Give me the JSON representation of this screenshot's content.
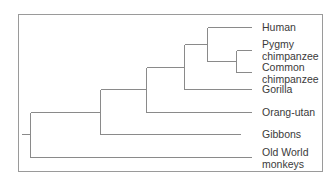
{
  "diagram": {
    "type": "phylogenetic-tree",
    "line_color": "#8a8a8a",
    "text_color": "#3a3a3a",
    "frame_color": "#9a9a9a",
    "taxa": [
      {
        "id": "human",
        "label": "Human",
        "line1": "Human",
        "line2": ""
      },
      {
        "id": "pygmy",
        "label": "Pygmy chimpanzee",
        "line1": "Pygmy",
        "line2": "chimpanzee"
      },
      {
        "id": "common",
        "label": "Common chimpanzee",
        "line1": "Common",
        "line2": "chimpanzee"
      },
      {
        "id": "gorilla",
        "label": "Gorilla",
        "line1": "Gorilla",
        "line2": ""
      },
      {
        "id": "orang",
        "label": "Orang-utan",
        "line1": "Orang-utan",
        "line2": ""
      },
      {
        "id": "gibbons",
        "label": "Gibbons",
        "line1": "Gibbons",
        "line2": ""
      },
      {
        "id": "owm",
        "label": "Old World monkeys",
        "line1": "Old World",
        "line2": "monkeys"
      }
    ],
    "labels": {
      "human": "Human",
      "pygmy": "Pygmy\nchimpanzee",
      "common": "Common\nchimpanzee",
      "gorilla": "Gorilla",
      "orang": "Orang-utan",
      "gibbons": "Gibbons",
      "owm": "Old World\nmonkeys"
    },
    "topology": "((((((Human,(Pygmy chimpanzee,Common chimpanzee)),Gorilla),Orang-utan),Gibbons),Old World monkeys))"
  }
}
